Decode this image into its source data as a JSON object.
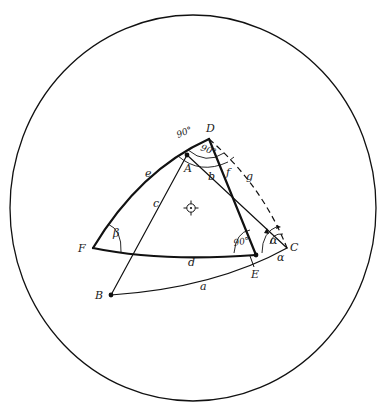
{
  "diagram": {
    "type": "spherical-geometry",
    "circle": {
      "cx": 193,
      "cy": 208,
      "rx": 183,
      "ry": 193
    },
    "center_mark": {
      "x": 191,
      "y": 208
    },
    "points": {
      "A": {
        "label": "A",
        "x": 187,
        "y": 155
      },
      "B": {
        "label": "B",
        "x": 111,
        "y": 295
      },
      "C": {
        "label": "C",
        "x": 287,
        "y": 248
      },
      "D": {
        "label": "D",
        "x": 209,
        "y": 139
      },
      "E": {
        "label": "E",
        "x": 256,
        "y": 255
      },
      "F": {
        "label": "F",
        "x": 93,
        "y": 248
      }
    },
    "lines": {
      "a": {
        "label": "a",
        "from": "B",
        "to": "C",
        "style": "thin"
      },
      "b": {
        "label": "b",
        "from": "A",
        "to": "C",
        "style": "thin"
      },
      "c": {
        "label": "c",
        "from": "A",
        "to": "B",
        "style": "thin"
      },
      "d": {
        "label": "d",
        "from": "F",
        "to": "E",
        "style": "thick"
      },
      "e": {
        "label": "e",
        "from": "F",
        "to": "D",
        "style": "thick"
      },
      "f": {
        "label": "f",
        "from": "D",
        "to": "E",
        "style": "thick"
      },
      "g": {
        "label": "g",
        "from": "D",
        "to": "C",
        "style": "dashed"
      }
    },
    "angles": {
      "D_outer": {
        "label": "90°"
      },
      "D_inner": {
        "label": "90°"
      },
      "E": {
        "label": "90°"
      },
      "C_inner": {
        "label": "α"
      },
      "C_outer": {
        "label": "α"
      },
      "F": {
        "label": "β"
      }
    }
  }
}
